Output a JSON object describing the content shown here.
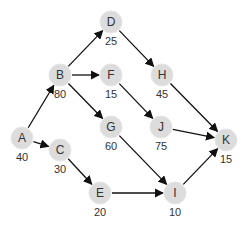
{
  "diagram": {
    "type": "directed-graph",
    "node_color": "#dcdcdc",
    "edge_color": "#111111",
    "nodes": [
      {
        "id": "A",
        "value": "40",
        "x": 22,
        "y": 138
      },
      {
        "id": "B",
        "value": "80",
        "x": 60,
        "y": 75
      },
      {
        "id": "C",
        "value": "30",
        "x": 60,
        "y": 150
      },
      {
        "id": "D",
        "value": "25",
        "x": 111,
        "y": 22
      },
      {
        "id": "E",
        "value": "20",
        "x": 100,
        "y": 193
      },
      {
        "id": "F",
        "value": "15",
        "x": 111,
        "y": 75
      },
      {
        "id": "G",
        "value": "60",
        "x": 111,
        "y": 127
      },
      {
        "id": "H",
        "value": "45",
        "x": 162,
        "y": 75
      },
      {
        "id": "I",
        "value": "10",
        "x": 175,
        "y": 193
      },
      {
        "id": "J",
        "value": "75",
        "x": 161,
        "y": 127
      },
      {
        "id": "K",
        "value": "15",
        "x": 226,
        "y": 140
      }
    ],
    "edges": [
      [
        "A",
        "B"
      ],
      [
        "A",
        "C"
      ],
      [
        "B",
        "D"
      ],
      [
        "B",
        "F"
      ],
      [
        "B",
        "G"
      ],
      [
        "C",
        "E"
      ],
      [
        "D",
        "H"
      ],
      [
        "F",
        "J"
      ],
      [
        "G",
        "I"
      ],
      [
        "E",
        "I"
      ],
      [
        "H",
        "K"
      ],
      [
        "J",
        "K"
      ],
      [
        "I",
        "K"
      ]
    ]
  }
}
